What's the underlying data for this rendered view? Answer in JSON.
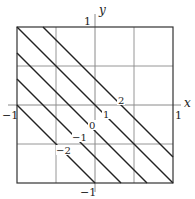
{
  "diagram": {
    "type": "contour-plot",
    "axes": {
      "x_label": "x",
      "y_label": "y",
      "x_ticks": [
        {
          "value": -1,
          "label": "−1"
        },
        {
          "value": 1,
          "label": "1"
        }
      ],
      "y_ticks": [
        {
          "value": 1,
          "label": "1"
        },
        {
          "value": -1,
          "label": "−1"
        }
      ],
      "xlim": [
        -1,
        1
      ],
      "ylim": [
        -1,
        1
      ],
      "grid_step": 0.5
    },
    "level_curves": [
      {
        "level": 2,
        "label": "2",
        "x_plus_y": 0.3333
      },
      {
        "level": 1,
        "label": "1",
        "x_plus_y": 0
      },
      {
        "level": 0,
        "label": "0",
        "x_plus_y": -0.3333
      },
      {
        "level": -1,
        "label": "−1",
        "x_plus_y": -0.6667
      },
      {
        "level": -2,
        "label": "−2",
        "x_plus_y": -1
      }
    ],
    "colors": {
      "line": "#222222",
      "grid": "#8a8a8a",
      "frame": "#333333",
      "background": "#ffffff"
    }
  }
}
